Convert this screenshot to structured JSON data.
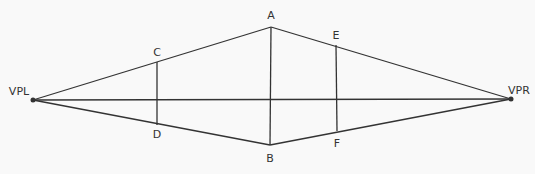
{
  "diagram": {
    "colors": {
      "background": "#f9f9f9",
      "line": "#333333",
      "text": "#333333"
    },
    "points": {
      "VPL": {
        "label": "VPL",
        "x": 33,
        "y": 100,
        "label_x": 19,
        "label_y": 91
      },
      "VPR": {
        "label": "VPR",
        "x": 511,
        "y": 99,
        "label_x": 519,
        "label_y": 90
      },
      "A": {
        "label": "A",
        "x": 271,
        "y": 27,
        "label_x": 271,
        "label_y": 15
      },
      "B": {
        "label": "B",
        "x": 270,
        "y": 145,
        "label_x": 270,
        "label_y": 158
      },
      "C": {
        "label": "C",
        "x": 157,
        "y": 62,
        "label_x": 157,
        "label_y": 52
      },
      "D": {
        "label": "D",
        "x": 157,
        "y": 125,
        "label_x": 157,
        "label_y": 134
      },
      "E": {
        "label": "E",
        "x": 336,
        "y": 45,
        "label_x": 336,
        "label_y": 35
      },
      "F": {
        "label": "F",
        "x": 337,
        "y": 131,
        "label_x": 337,
        "label_y": 143
      }
    },
    "segments": [
      {
        "from": "VPL",
        "to": "A"
      },
      {
        "from": "VPL",
        "to": "B"
      },
      {
        "from": "VPR",
        "to": "A"
      },
      {
        "from": "VPR",
        "to": "B"
      },
      {
        "from": "VPL",
        "to": "VPR"
      },
      {
        "from": "A",
        "to": "B"
      },
      {
        "from": "C",
        "to": "D"
      },
      {
        "from": "E",
        "to": "F"
      }
    ],
    "labels": [
      "VPL",
      "VPR",
      "A",
      "B",
      "C",
      "D",
      "E",
      "F"
    ]
  }
}
